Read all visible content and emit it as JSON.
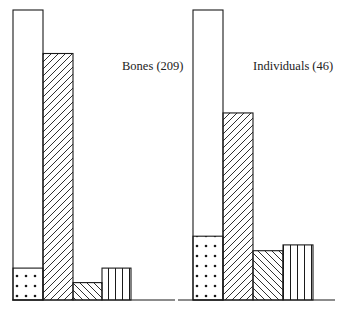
{
  "chart_data": {
    "type": "bar",
    "title": "",
    "xlabel": "",
    "ylabel": "",
    "grid": false,
    "legend": "none",
    "baseline_y": 300,
    "top_y": 10,
    "panels": [
      {
        "label": "Bones (209)",
        "label_pos": [
          122,
          70
        ],
        "baseline_x": [
          12,
          175
        ],
        "bars": [
          {
            "pattern": "blank",
            "x": 13,
            "w": 30,
            "value": 100,
            "inset_dotted_value": 11
          },
          {
            "pattern": "diag-right",
            "x": 43,
            "w": 30,
            "value": 85
          },
          {
            "pattern": "diag-left",
            "x": 73,
            "w": 29,
            "value": 6
          },
          {
            "pattern": "vertical",
            "x": 102,
            "w": 29,
            "value": 11
          }
        ]
      },
      {
        "label": "Individuals (46)",
        "label_pos": [
          253,
          70
        ],
        "baseline_x": [
          178,
          335
        ],
        "bars": [
          {
            "pattern": "blank",
            "x": 193,
            "w": 30,
            "value": 100,
            "inset_dotted_value": 22
          },
          {
            "pattern": "diag-right",
            "x": 223,
            "w": 30,
            "value": 64.5
          },
          {
            "pattern": "diag-left",
            "x": 253,
            "w": 30,
            "value": 17
          },
          {
            "pattern": "vertical",
            "x": 283,
            "w": 30,
            "value": 19
          }
        ]
      }
    ]
  },
  "colors": {
    "stroke": "#1a1a1a",
    "background": "#ffffff",
    "text": "#222222"
  }
}
